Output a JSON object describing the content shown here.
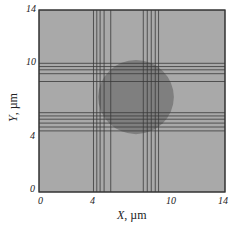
{
  "chart_data": {
    "type": "diagram",
    "title": "",
    "xlabel": "X, µm",
    "ylabel": "Y, µm",
    "xlim": [
      0,
      14
    ],
    "ylim": [
      0,
      14
    ],
    "x_ticks": [
      "0",
      "4",
      "10",
      "14"
    ],
    "y_ticks": [
      "0",
      "4",
      "10",
      "14"
    ],
    "background_color": "#a9a9a9",
    "circle": {
      "cx": 7.3,
      "cy": 7.3,
      "r": 2.85,
      "color": "#7f7f7f"
    },
    "vertical_lines_x": [
      4.1,
      4.35,
      4.6,
      4.9,
      5.4,
      7.85,
      8.15,
      8.45,
      8.75,
      9.0
    ],
    "horizontal_lines_y": [
      9.9,
      9.65,
      9.4,
      9.1,
      8.5,
      6.1,
      5.85,
      5.6,
      5.3,
      5.0,
      4.7
    ],
    "line_color": "#3a3a3a",
    "grid": false,
    "legend": null
  },
  "axes": {
    "x_label_var": "X",
    "x_label_unit": ", µm",
    "y_label_var": "Y",
    "y_label_unit": ", µm",
    "x_tick_0": "0",
    "x_tick_4": "4",
    "x_tick_10": "10",
    "x_tick_14": "14",
    "y_tick_0": "0",
    "y_tick_4": "4",
    "y_tick_10": "10",
    "y_tick_14": "14"
  }
}
